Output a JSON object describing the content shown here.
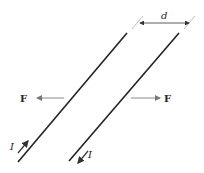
{
  "diagram": {
    "labels": {
      "separation": "d",
      "force_left": "F",
      "force_right": "F",
      "current_left": "I",
      "current_right": "I"
    },
    "wires": [
      {
        "name": "left-wire",
        "current_direction": "up-right"
      },
      {
        "name": "right-wire",
        "current_direction": "down-left"
      }
    ],
    "forces": [
      {
        "name": "left-force",
        "direction": "left"
      },
      {
        "name": "right-force",
        "direction": "right"
      }
    ],
    "colors": {
      "wire": "#222222",
      "arrow": "#888888",
      "text": "#222222"
    }
  }
}
